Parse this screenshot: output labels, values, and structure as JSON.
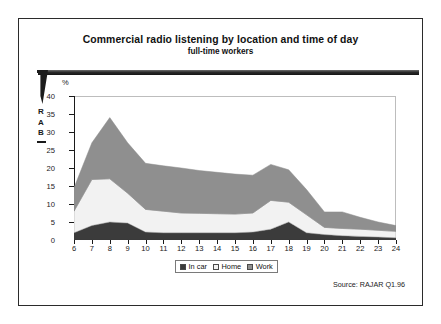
{
  "brand": {
    "name": "RAB",
    "letters": [
      "R",
      "A",
      "B"
    ],
    "arrow_icon": "down-arrow-icon"
  },
  "header": {
    "title": "Commercial radio listening by location and time of day",
    "subtitle": "full-time workers"
  },
  "footer": {
    "source": "Source:  RAJAR Q1.96"
  },
  "legend": {
    "position": "bottom-center",
    "items": [
      {
        "label": "In car",
        "color": "#3b3b3b"
      },
      {
        "label": "Home",
        "color": "#f2f2f2"
      },
      {
        "label": "Work",
        "color": "#8f8f8f"
      }
    ]
  },
  "chart_data": {
    "type": "area",
    "stacked": true,
    "title": "Commercial radio listening by location and time of day",
    "subtitle": "full-time workers",
    "xlabel": "",
    "ylabel": "%",
    "y_unit_label": "%",
    "xlim": [
      6,
      24
    ],
    "ylim": [
      0,
      40
    ],
    "yticks": [
      0,
      5,
      10,
      15,
      20,
      25,
      30,
      35,
      40
    ],
    "grid": false,
    "categories": [
      6,
      7,
      8,
      9,
      10,
      11,
      12,
      13,
      14,
      15,
      16,
      17,
      18,
      19,
      20,
      21,
      22,
      23,
      24
    ],
    "xtick_labels": [
      "6",
      "7",
      "8",
      "9",
      "10",
      "11",
      "12",
      "13",
      "14",
      "15",
      "16",
      "17",
      "18",
      "19",
      "20",
      "21",
      "22",
      "23",
      "24"
    ],
    "series": [
      {
        "name": "In car",
        "color": "#3b3b3b",
        "values": [
          2.0,
          4.0,
          5.0,
          4.7,
          2.2,
          2.0,
          2.0,
          2.0,
          2.0,
          2.0,
          2.2,
          3.0,
          5.0,
          2.0,
          1.5,
          1.2,
          1.0,
          0.8,
          0.6
        ]
      },
      {
        "name": "Home",
        "color": "#f2f2f2",
        "values": [
          6.0,
          12.8,
          12.0,
          8.3,
          6.3,
          6.0,
          5.5,
          5.4,
          5.3,
          5.2,
          5.3,
          8.0,
          5.5,
          5.0,
          2.0,
          2.0,
          2.0,
          1.9,
          1.8
        ]
      },
      {
        "name": "Work",
        "color": "#8f8f8f",
        "values": [
          6.5,
          10.2,
          17.0,
          14.0,
          12.8,
          12.6,
          12.5,
          11.9,
          11.5,
          11.1,
          10.5,
          10.0,
          9.0,
          7.0,
          4.3,
          4.6,
          3.3,
          2.3,
          1.6
        ]
      }
    ],
    "cumulative": {
      "in_car": [
        2.0,
        4.0,
        5.0,
        4.7,
        2.2,
        2.0,
        2.0,
        2.0,
        2.0,
        2.0,
        2.2,
        3.0,
        5.0,
        2.0,
        1.5,
        1.2,
        1.0,
        0.8,
        0.6
      ],
      "in_car_home": [
        8.0,
        16.8,
        17.0,
        13.0,
        8.5,
        8.0,
        7.5,
        7.4,
        7.3,
        7.2,
        7.5,
        11.0,
        10.5,
        7.0,
        3.5,
        3.2,
        3.0,
        2.7,
        2.4
      ],
      "total": [
        14.5,
        27.0,
        34.0,
        27.0,
        21.3,
        20.6,
        20.0,
        19.3,
        18.8,
        18.3,
        18.0,
        21.0,
        19.5,
        14.0,
        7.8,
        7.8,
        6.3,
        5.0,
        4.0
      ]
    },
    "annotations": [
      "Source:  RAJAR Q1.96"
    ]
  }
}
